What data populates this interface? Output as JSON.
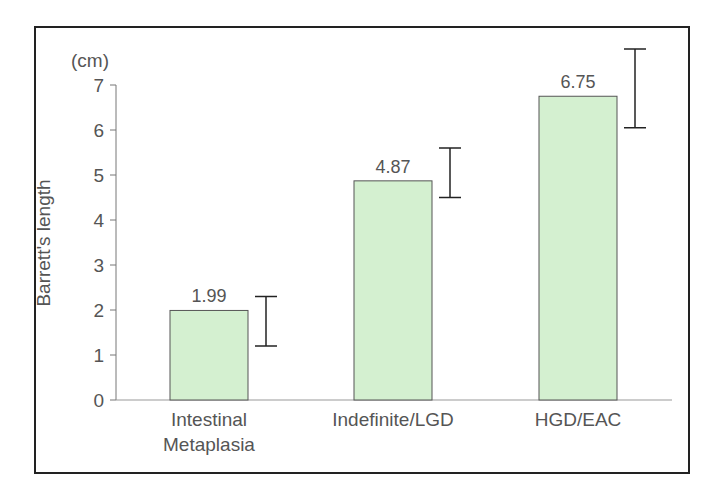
{
  "chart_data": {
    "type": "bar",
    "title": "",
    "xlabel": "",
    "ylabel": "Barrett's length",
    "yunit": "(cm)",
    "ylim": [
      0,
      7
    ],
    "yticks": [
      "0",
      "1",
      "2",
      "3",
      "4",
      "5",
      "6",
      "7"
    ],
    "categories": [
      "Intestinal Metaplasia",
      "Indefinite/LGD",
      "HGD/EAC"
    ],
    "category_lines": [
      [
        "Intestinal",
        "Metaplasia"
      ],
      [
        "Indefinite/LGD"
      ],
      [
        "HGD/EAC"
      ]
    ],
    "values": [
      1.99,
      4.87,
      6.75
    ],
    "value_labels": [
      "1.99",
      "4.87",
      "6.75"
    ],
    "error_bars": [
      {
        "low": 1.2,
        "high": 2.3
      },
      {
        "low": 4.5,
        "high": 5.6
      },
      {
        "low": 6.05,
        "high": 7.8
      }
    ],
    "grid": false,
    "legend": "none",
    "bar_color": "#d4f0d0",
    "bar_edge_color": "#555555"
  }
}
